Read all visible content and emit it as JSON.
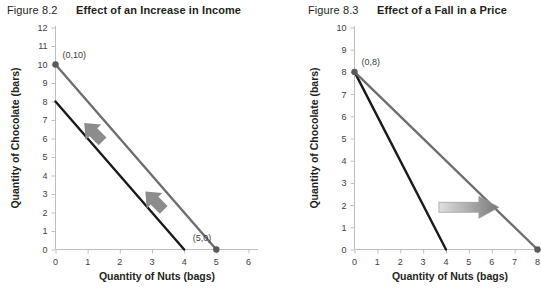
{
  "figures": [
    {
      "number": "Figure 8.2",
      "title": "Effect of an Increase in Income",
      "xlabel": "Quantity of Nuts (bags)",
      "ylabel": "Quantity of Chocolate (bars)",
      "point_labels": {
        "a": "(0,10)",
        "b": "(5,0)"
      }
    },
    {
      "number": "Figure 8.3",
      "title": "Effect of a Fall in a Price",
      "xlabel": "Quantity of Nuts (bags)",
      "ylabel": "Quantity of Chocolate (bars)",
      "point_labels": {
        "a": "(0,8)"
      }
    }
  ],
  "chart_data": [
    {
      "type": "line",
      "title": "Effect of an Increase in Income",
      "xlabel": "Quantity of Nuts (bags)",
      "ylabel": "Quantity of Chocolate (bars)",
      "xlim": [
        0,
        6
      ],
      "ylim": [
        0,
        12
      ],
      "xticks": [
        0,
        1,
        2,
        3,
        4,
        5,
        6
      ],
      "yticks": [
        0,
        1,
        2,
        3,
        4,
        5,
        6,
        7,
        8,
        9,
        10,
        11,
        12
      ],
      "grid": false,
      "legend": "none",
      "series": [
        {
          "name": "original budget constraint",
          "color": "#1a1a1a",
          "x": [
            0,
            4
          ],
          "y": [
            8,
            0
          ],
          "markers": []
        },
        {
          "name": "new budget constraint",
          "color": "#6e6e6e",
          "x": [
            0,
            5
          ],
          "y": [
            10,
            0
          ],
          "markers": [
            {
              "x": 0,
              "y": 10,
              "label": "(0,10)"
            },
            {
              "x": 5,
              "y": 0,
              "label": "(5,0)"
            }
          ]
        }
      ],
      "annotations": [
        {
          "type": "block-arrow",
          "direction": "up-right",
          "x": 1.2,
          "y": 6.3
        },
        {
          "type": "block-arrow",
          "direction": "up-right",
          "x": 3.1,
          "y": 2.6
        }
      ]
    },
    {
      "type": "line",
      "title": "Effect of a Fall in a Price",
      "xlabel": "Quantity of Nuts (bags)",
      "ylabel": "Quantity of Chocolate (bars)",
      "xlim": [
        0,
        8
      ],
      "ylim": [
        0,
        10
      ],
      "xticks": [
        0,
        1,
        2,
        3,
        4,
        5,
        6,
        7,
        8
      ],
      "yticks": [
        0,
        1,
        2,
        3,
        4,
        5,
        6,
        7,
        8,
        9,
        10
      ],
      "grid": false,
      "legend": "none",
      "series": [
        {
          "name": "original budget constraint",
          "color": "#1a1a1a",
          "x": [
            0,
            4
          ],
          "y": [
            8,
            0
          ],
          "markers": []
        },
        {
          "name": "new budget constraint",
          "color": "#6e6e6e",
          "x": [
            0,
            8
          ],
          "y": [
            8,
            0
          ],
          "markers": [
            {
              "x": 0,
              "y": 8,
              "label": "(0,8)"
            },
            {
              "x": 8,
              "y": 0,
              "label": ""
            }
          ]
        }
      ],
      "annotations": [
        {
          "type": "block-arrow",
          "direction": "right",
          "x": 5.0,
          "y": 1.9
        }
      ]
    }
  ],
  "footer": {
    "cut_text": ""
  }
}
